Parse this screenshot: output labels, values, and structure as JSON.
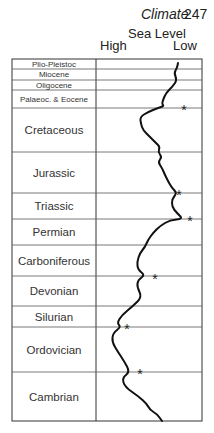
{
  "header": {
    "running_title": "Climate",
    "page_number": "247"
  },
  "axis": {
    "title": "Sea Level",
    "high_label": "High",
    "low_label": "Low"
  },
  "periods": [
    {
      "name": "Plio-Pleistoc",
      "top": 59,
      "bottom": 69,
      "small": true
    },
    {
      "name": "Miocene",
      "top": 69,
      "bottom": 80,
      "small": true
    },
    {
      "name": "Oligocene",
      "top": 80,
      "bottom": 90,
      "small": true
    },
    {
      "name": "Palaeoc. & Eocene",
      "top": 90,
      "bottom": 108,
      "small": true
    },
    {
      "name": "Cretaceous",
      "top": 108,
      "bottom": 152,
      "small": false
    },
    {
      "name": "Jurassic",
      "top": 152,
      "bottom": 193,
      "small": false
    },
    {
      "name": "Triassic",
      "top": 193,
      "bottom": 219,
      "small": false
    },
    {
      "name": "Permian",
      "top": 219,
      "bottom": 245,
      "small": false
    },
    {
      "name": "Carboniferous",
      "top": 245,
      "bottom": 276,
      "small": false
    },
    {
      "name": "Devonian",
      "top": 276,
      "bottom": 306,
      "small": false
    },
    {
      "name": "Silurian",
      "top": 306,
      "bottom": 327,
      "small": false
    },
    {
      "name": "Ordovician",
      "top": 327,
      "bottom": 372,
      "small": false
    },
    {
      "name": "Cambrian",
      "top": 372,
      "bottom": 421,
      "small": false
    }
  ],
  "curve_points": [
    [
      178,
      63
    ],
    [
      177,
      68
    ],
    [
      174,
      73
    ],
    [
      177,
      80
    ],
    [
      173,
      86
    ],
    [
      166,
      93
    ],
    [
      163,
      100
    ],
    [
      162,
      104
    ],
    [
      164,
      106
    ],
    [
      158,
      108
    ],
    [
      148,
      112
    ],
    [
      140,
      117
    ],
    [
      141,
      124
    ],
    [
      143,
      130
    ],
    [
      150,
      137
    ],
    [
      156,
      143
    ],
    [
      160,
      147
    ],
    [
      158,
      152
    ],
    [
      162,
      157
    ],
    [
      158,
      162
    ],
    [
      162,
      168
    ],
    [
      165,
      175
    ],
    [
      168,
      181
    ],
    [
      172,
      188
    ],
    [
      177,
      193
    ],
    [
      172,
      199
    ],
    [
      172,
      207
    ],
    [
      177,
      213
    ],
    [
      183,
      219
    ],
    [
      170,
      220
    ],
    [
      160,
      226
    ],
    [
      153,
      233
    ],
    [
      148,
      240
    ],
    [
      145,
      247
    ],
    [
      140,
      253
    ],
    [
      137,
      262
    ],
    [
      138,
      270
    ],
    [
      145,
      275
    ],
    [
      138,
      280
    ],
    [
      137,
      287
    ],
    [
      142,
      297
    ],
    [
      133,
      306
    ],
    [
      122,
      315
    ],
    [
      117,
      323
    ],
    [
      121,
      327
    ],
    [
      113,
      333
    ],
    [
      112,
      342
    ],
    [
      118,
      352
    ],
    [
      124,
      361
    ],
    [
      130,
      372
    ],
    [
      122,
      378
    ],
    [
      125,
      387
    ],
    [
      138,
      396
    ],
    [
      147,
      404
    ],
    [
      150,
      410
    ],
    [
      157,
      414
    ],
    [
      162,
      421
    ]
  ],
  "markers": [
    {
      "label": "*",
      "x": 184,
      "y": 108
    },
    {
      "label": "*",
      "x": 179,
      "y": 193
    },
    {
      "label": "*",
      "x": 190,
      "y": 219
    },
    {
      "label": "*",
      "x": 155,
      "y": 277
    },
    {
      "label": "*",
      "x": 127,
      "y": 327
    },
    {
      "label": "*",
      "x": 140,
      "y": 372
    }
  ]
}
